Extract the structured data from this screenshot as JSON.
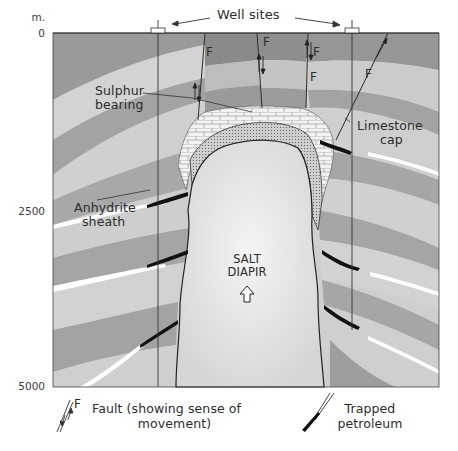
{
  "diagram": {
    "type": "geological cross-section",
    "depth_axis": {
      "unit": "m.",
      "ticks": [
        {
          "label": "0",
          "y": 33
        },
        {
          "label": "2500",
          "y": 212
        },
        {
          "label": "5000",
          "y": 387
        }
      ]
    },
    "labels": {
      "well_sites": "Well sites",
      "sulphur_line1": "Sulphur",
      "sulphur_line2": "bearing",
      "limestone_line1": "Limestone",
      "limestone_line2": "cap",
      "anhydrite_line1": "Anhydrite",
      "anhydrite_line2": "sheath",
      "salt_line1": "SALT",
      "salt_line2": "DIAPIR",
      "fault_marker": "F"
    },
    "legend": {
      "fault_symbol": "F",
      "fault_line1": "Fault (showing sense of",
      "fault_line2": "movement)",
      "petroleum_line1": "Trapped",
      "petroleum_line2": "petroleum"
    },
    "colors": {
      "background": "#ffffff",
      "dark_strata": "#8f8f8f",
      "mid_strata": "#a9a9a9",
      "light_strata": "#cfcfcf",
      "salt": "#e3e3e3",
      "limestone": "#efefef",
      "anhydrite": "#bdbdbd",
      "petroleum": "#111111",
      "line": "#2a2a2a"
    }
  }
}
